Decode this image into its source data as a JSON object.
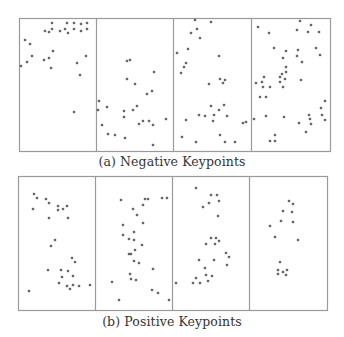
{
  "figure": {
    "colors": {
      "border": "#9a9a9a",
      "point": "#3a3a3a",
      "background": "#ffffff"
    },
    "subfigures": [
      {
        "id": "a",
        "caption": "(a) Negative Keypoints",
        "frame": {
          "x": 19,
          "y": 18,
          "w": 311,
          "h": 133
        },
        "dividers_x": [
          96,
          173,
          251
        ],
        "panels": [
          {
            "points": [
              [
                52,
                23
              ],
              [
                67,
                23
              ],
              [
                74,
                23
              ],
              [
                81,
                24
              ],
              [
                87,
                23
              ],
              [
                45,
                31
              ],
              [
                49,
                32
              ],
              [
                52,
                29
              ],
              [
                60,
                31
              ],
              [
                65,
                29
              ],
              [
                68,
                33
              ],
              [
                74,
                29
              ],
              [
                81,
                31
              ],
              [
                87,
                29
              ],
              [
                25,
                40
              ],
              [
                30,
                44
              ],
              [
                53,
                51
              ],
              [
                32,
                56
              ],
              [
                44,
                60
              ],
              [
                49,
                58
              ],
              [
                86,
                56
              ],
              [
                27,
                62
              ],
              [
                21,
                66
              ],
              [
                51,
                68
              ],
              [
                77,
                63
              ],
              [
                80,
                75
              ],
              [
                74,
                112
              ]
            ]
          },
          {
            "points": [
              [
                127,
                61
              ],
              [
                130,
                60
              ],
              [
                154,
                72
              ],
              [
                127,
                79
              ],
              [
                135,
                84
              ],
              [
                147,
                94
              ],
              [
                152,
                91
              ],
              [
                99,
                101
              ],
              [
                98,
                110
              ],
              [
                107,
                107
              ],
              [
                124,
                111
              ],
              [
                133,
                110
              ],
              [
                137,
                106
              ],
              [
                124,
                117
              ],
              [
                143,
                121
              ],
              [
                149,
                121
              ],
              [
                139,
                124
              ],
              [
                153,
                125
              ],
              [
                166,
                119
              ],
              [
                102,
                125
              ],
              [
                108,
                134
              ],
              [
                115,
                135
              ],
              [
                125,
                138
              ],
              [
                153,
                145
              ]
            ]
          },
          {
            "points": [
              [
                195,
                20
              ],
              [
                211,
                22
              ],
              [
                197,
                29
              ],
              [
                191,
                33
              ],
              [
                200,
                38
              ],
              [
                188,
                49
              ],
              [
                177,
                53
              ],
              [
                219,
                56
              ],
              [
                186,
                63
              ],
              [
                184,
                67
              ],
              [
                181,
                73
              ],
              [
                220,
                79
              ],
              [
                225,
                80
              ],
              [
                223,
                83
              ],
              [
                209,
                84
              ],
              [
                211,
                106
              ],
              [
                224,
                105
              ],
              [
                219,
                110
              ],
              [
                199,
                115
              ],
              [
                205,
                116
              ],
              [
                214,
                115
              ],
              [
                227,
                116
              ],
              [
                186,
                120
              ],
              [
                213,
                121
              ],
              [
                243,
                123
              ],
              [
                246,
                122
              ],
              [
                220,
                135
              ],
              [
                182,
                137
              ],
              [
                196,
                142
              ],
              [
                225,
                142
              ],
              [
                235,
                142
              ]
            ]
          },
          {
            "points": [
              [
                300,
                21
              ],
              [
                311,
                25
              ],
              [
                258,
                27
              ],
              [
                297,
                30
              ],
              [
                308,
                32
              ],
              [
                319,
                32
              ],
              [
                269,
                33
              ],
              [
                274,
                48
              ],
              [
                286,
                51
              ],
              [
                298,
                50
              ],
              [
                316,
                48
              ],
              [
                320,
                55
              ],
              [
                297,
                56
              ],
              [
                283,
                58
              ],
              [
                302,
                62
              ],
              [
                286,
                67
              ],
              [
                286,
                72
              ],
              [
                282,
                74
              ],
              [
                264,
                77
              ],
              [
                280,
                77
              ],
              [
                285,
                79
              ],
              [
                262,
                82
              ],
              [
                256,
                83
              ],
              [
                280,
                82
              ],
              [
                301,
                80
              ],
              [
                263,
                87
              ],
              [
                270,
                87
              ],
              [
                283,
                87
              ],
              [
                260,
                97
              ],
              [
                266,
                97
              ],
              [
                325,
                101
              ],
              [
                321,
                108
              ],
              [
                322,
                115
              ],
              [
                266,
                116
              ],
              [
                284,
                117
              ],
              [
                309,
                115
              ],
              [
                310,
                119
              ],
              [
                325,
                120
              ],
              [
                254,
                119
              ],
              [
                299,
                123
              ],
              [
                311,
                124
              ],
              [
                306,
                132
              ],
              [
                275,
                135
              ],
              [
                275,
                141
              ],
              [
                270,
                141
              ]
            ]
          }
        ]
      },
      {
        "id": "b",
        "caption": "(b) Positive Keypoints",
        "frame": {
          "x": 18,
          "y": 176,
          "w": 309,
          "h": 134
        },
        "dividers_x": [
          95,
          172,
          249
        ],
        "panels": [
          {
            "points": [
              [
                34,
                194
              ],
              [
                37,
                198
              ],
              [
                46,
                199
              ],
              [
                49,
                203
              ],
              [
                58,
                206
              ],
              [
                67,
                206
              ],
              [
                33,
                209
              ],
              [
                58,
                210
              ],
              [
                63,
                209
              ],
              [
                49,
                218
              ],
              [
                68,
                218
              ],
              [
                55,
                240
              ],
              [
                51,
                246
              ],
              [
                72,
                258
              ],
              [
                75,
                262
              ],
              [
                48,
                270
              ],
              [
                61,
                270
              ],
              [
                68,
                271
              ],
              [
                62,
                277
              ],
              [
                73,
                276
              ],
              [
                59,
                283
              ],
              [
                67,
                286
              ],
              [
                73,
                285
              ],
              [
                79,
                286
              ],
              [
                70,
                289
              ],
              [
                90,
                285
              ],
              [
                29,
                291
              ]
            ]
          },
          {
            "points": [
              [
                121,
                200
              ],
              [
                145,
                199
              ],
              [
                148,
                199
              ],
              [
                162,
                198
              ],
              [
                167,
                198
              ],
              [
                143,
                205
              ],
              [
                133,
                209
              ],
              [
                137,
                215
              ],
              [
                143,
                223
              ],
              [
                123,
                225
              ],
              [
                134,
                232
              ],
              [
                123,
                235
              ],
              [
                129,
                239
              ],
              [
                134,
                240
              ],
              [
                142,
                245
              ],
              [
                135,
                250
              ],
              [
                129,
                254
              ],
              [
                131,
                254
              ],
              [
                134,
                261
              ],
              [
                139,
                263
              ],
              [
                153,
                269
              ],
              [
                130,
                274
              ],
              [
                131,
                279
              ],
              [
                136,
                280
              ],
              [
                112,
                282
              ],
              [
                152,
                290
              ],
              [
                158,
                293
              ],
              [
                119,
                300
              ],
              [
                169,
                300
              ]
            ]
          },
          {
            "points": [
              [
                196,
                188
              ],
              [
                211,
                195
              ],
              [
                217,
                195
              ],
              [
                219,
                201
              ],
              [
                209,
                203
              ],
              [
                203,
                207
              ],
              [
                218,
                216
              ],
              [
                211,
                238
              ],
              [
                216,
                238
              ],
              [
                219,
                241
              ],
              [
                206,
                244
              ],
              [
                215,
                244
              ],
              [
                226,
                253
              ],
              [
                229,
                257
              ],
              [
                227,
                265
              ],
              [
                199,
                260
              ],
              [
                214,
                260
              ],
              [
                205,
                268
              ],
              [
                206,
                275
              ],
              [
                212,
                276
              ],
              [
                196,
                278
              ],
              [
                208,
                281
              ],
              [
                193,
                283
              ],
              [
                200,
                283
              ],
              [
                176,
                283
              ]
            ]
          },
          {
            "points": [
              [
                289,
                201
              ],
              [
                293,
                204
              ],
              [
                283,
                211
              ],
              [
                292,
                212
              ],
              [
                281,
                221
              ],
              [
                293,
                222
              ],
              [
                270,
                226
              ],
              [
                275,
                237
              ],
              [
                298,
                240
              ],
              [
                280,
                262
              ],
              [
                278,
                270
              ],
              [
                287,
                270
              ],
              [
                283,
                272
              ],
              [
                278,
                274
              ],
              [
                286,
                275
              ]
            ]
          }
        ]
      }
    ]
  }
}
